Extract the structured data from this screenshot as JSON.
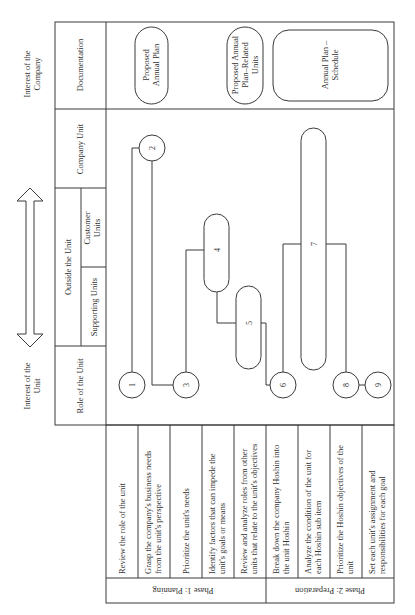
{
  "axis": {
    "top_label_line1": "Interest of the",
    "top_label_line2": "Company",
    "bottom_label_line1": "Interest of the",
    "bottom_label_line2": "Unit"
  },
  "rows": {
    "documentation": "Documentation",
    "company_unit": "Company Unit",
    "outside_the_unit": "Outside the Unit",
    "customer_units_line1": "Customer",
    "customer_units_line2": "Units",
    "supporting_units": "Supporting Units",
    "role_of_the_unit": "Role of the Unit"
  },
  "documents": [
    {
      "line1": "Proposed",
      "line2": "Annual Plan",
      "line3": ""
    },
    {
      "line1": "Proposed Annual",
      "line2": "Plan–Related",
      "line3": "Units"
    },
    {
      "line1": "Annual Plan –",
      "line2": "Schedule",
      "line3": ""
    }
  ],
  "nodes": [
    "1",
    "2",
    "3",
    "4",
    "5",
    "6",
    "7",
    "8",
    "9"
  ],
  "steps": [
    {
      "line1": "Review the role of the unit",
      "line2": ""
    },
    {
      "line1": "Grasp the company's business needs",
      "line2": "from the unit's perspective"
    },
    {
      "line1": "Prioritize the unit's needs",
      "line2": ""
    },
    {
      "line1": "Identify factors that can impede the",
      "line2": "unit's goals or means"
    },
    {
      "line1": "Review and analyze roles from other",
      "line2": "units that relate to the unit's objectives"
    },
    {
      "line1": "Break down the company Hoshin into",
      "line2": "the unit Hoshin"
    },
    {
      "line1": "Analyze the condition of the unit for",
      "line2": "each Hoshin sub item"
    },
    {
      "line1": "Prioritize the Hoshin objectives of the",
      "line2": "unit"
    },
    {
      "line1": "Set each unit's assignment and",
      "line2": "responsibilities for each goal"
    }
  ],
  "phases": [
    {
      "label": "Phase 1: Planning"
    },
    {
      "label": "Phase 2: Preparation"
    }
  ]
}
